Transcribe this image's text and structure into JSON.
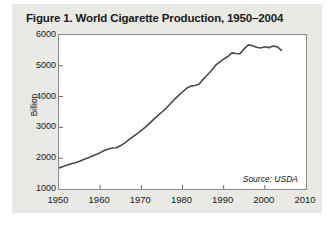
{
  "figure": {
    "title": "Figure 1. World Cigarette Production, 1950–2004",
    "source_note": "Source: USDA"
  },
  "chart_data": {
    "type": "line",
    "title": "Figure 1. World Cigarette Production, 1950–2004",
    "xlabel": "",
    "ylabel": "Billion",
    "xlim": [
      1950,
      2010
    ],
    "ylim": [
      1000,
      6000
    ],
    "xticks": [
      1950,
      1960,
      1970,
      1980,
      1990,
      2000,
      2010
    ],
    "yticks": [
      1000,
      2000,
      3000,
      4000,
      5000,
      6000
    ],
    "grid": false,
    "legend": "none",
    "line_color": "#4a4a4a",
    "series": [
      {
        "name": "World cigarette production",
        "units": "billion cigarettes",
        "x": [
          1950,
          1951,
          1952,
          1953,
          1954,
          1955,
          1956,
          1957,
          1958,
          1959,
          1960,
          1961,
          1962,
          1963,
          1964,
          1965,
          1966,
          1967,
          1968,
          1969,
          1970,
          1971,
          1972,
          1973,
          1974,
          1975,
          1976,
          1977,
          1978,
          1979,
          1980,
          1981,
          1982,
          1983,
          1984,
          1985,
          1986,
          1987,
          1988,
          1989,
          1990,
          1991,
          1992,
          1993,
          1994,
          1995,
          1996,
          1997,
          1998,
          1999,
          2000,
          2001,
          2002,
          2003,
          2004
        ],
        "values": [
          1686,
          1730,
          1780,
          1820,
          1850,
          1900,
          1960,
          2010,
          2060,
          2120,
          2180,
          2250,
          2300,
          2330,
          2340,
          2410,
          2500,
          2600,
          2700,
          2800,
          2900,
          3010,
          3130,
          3260,
          3380,
          3500,
          3620,
          3760,
          3900,
          4030,
          4150,
          4270,
          4340,
          4360,
          4400,
          4560,
          4700,
          4840,
          5010,
          5120,
          5220,
          5300,
          5420,
          5400,
          5390,
          5560,
          5680,
          5650,
          5600,
          5580,
          5620,
          5590,
          5640,
          5620,
          5500
        ]
      }
    ]
  },
  "axis": {
    "y_tick_labels": [
      "6000",
      "5000",
      "4000",
      "3000",
      "2000",
      "1000"
    ],
    "x_tick_labels": [
      "1950",
      "1960",
      "1970",
      "1980",
      "1990",
      "2000",
      "2010"
    ]
  }
}
